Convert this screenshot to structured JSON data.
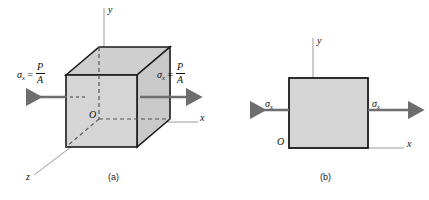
{
  "figure": {
    "panels": [
      {
        "id": "a",
        "caption": "(a)",
        "type": "3d-cube-stress-element",
        "axes": [
          {
            "name": "y-axis",
            "label": "y",
            "direction": "up"
          },
          {
            "name": "x-axis",
            "label": "x",
            "direction": "right"
          },
          {
            "name": "z-axis",
            "label": "z",
            "direction": "lower-left"
          }
        ],
        "origin_label": "O",
        "stress_left": {
          "symbol": "σ",
          "subscript": "x",
          "equals": "=",
          "numerator": "P",
          "denominator": "A",
          "arrow": "left"
        },
        "stress_right": {
          "symbol": "σ",
          "subscript": "x",
          "equals": "=",
          "numerator": "P",
          "denominator": "A",
          "arrow": "right"
        }
      },
      {
        "id": "b",
        "caption": "(b)",
        "type": "2d-square-stress-element",
        "axes": [
          {
            "name": "y-axis",
            "label": "y",
            "direction": "up"
          },
          {
            "name": "x-axis",
            "label": "x",
            "direction": "right"
          }
        ],
        "origin_label": "O",
        "stress_left": {
          "symbol": "σ",
          "subscript": "x",
          "arrow": "left"
        },
        "stress_right": {
          "symbol": "σ",
          "subscript": "x",
          "arrow": "right"
        }
      }
    ],
    "colors": {
      "face_fill": "#d5d5d5",
      "face_fill_top": "#cfcfcf",
      "face_fill_side": "#c9c9c9",
      "outline": "#1a1a1a",
      "axis_line": "#9a9a9a",
      "arrow": "#6e6e6e",
      "hidden_edge": "#555555",
      "background": "#ffffff"
    }
  }
}
